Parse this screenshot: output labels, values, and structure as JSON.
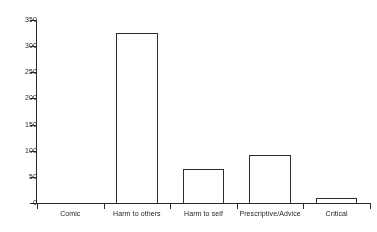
{
  "chart_data": {
    "type": "bar",
    "title": "",
    "subtitle": "",
    "xlabel": "",
    "ylabel": "",
    "categories": [
      "Comic",
      "Harm to others",
      "Harm to self",
      "Prescriptive/Advice",
      "Critical"
    ],
    "values": [
      0,
      325,
      65,
      92,
      9
    ],
    "series": [
      {
        "name": "Count",
        "values": [
          0,
          325,
          65,
          92,
          9
        ]
      }
    ],
    "ylim": [
      0,
      350
    ],
    "ytick_values": [
      0,
      50,
      100,
      150,
      200,
      250,
      300,
      350
    ],
    "ytick_labels": [
      "0",
      "50",
      "100",
      "150",
      "200",
      "250",
      "300",
      "350"
    ],
    "ytick_step": 50,
    "grid": false,
    "legend": false,
    "legend_position": "none",
    "bar_style": {
      "fill": "none",
      "edge_color": "#2e2e2e",
      "edge_width": 1
    },
    "axis_color": "#2b2b2b",
    "background_color": "#ffffff",
    "annotations": []
  }
}
